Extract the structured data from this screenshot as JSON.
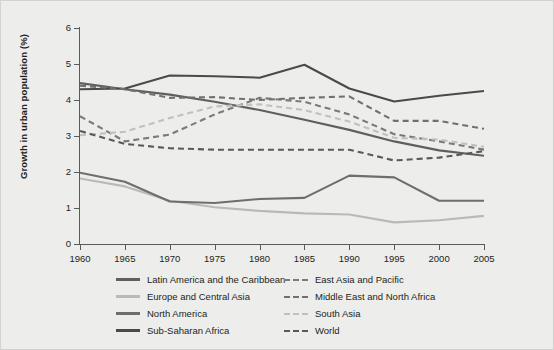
{
  "chart_data": {
    "type": "line",
    "title": "",
    "xlabel": "",
    "ylabel": "Growth in urban population (%)",
    "x": [
      1960,
      1965,
      1970,
      1975,
      1980,
      1985,
      1990,
      1995,
      2000,
      2005
    ],
    "xtick_labels": [
      "1960",
      "1965",
      "1970",
      "1975",
      "1980",
      "1985",
      "1990",
      "1995",
      "2000",
      "2005"
    ],
    "ytick_labels": [
      "0",
      "1",
      "2",
      "3",
      "4",
      "5",
      "6"
    ],
    "xlim": [
      1960,
      2005
    ],
    "ylim": [
      0,
      6
    ],
    "grid": false,
    "legend_position": "bottom",
    "series": [
      {
        "name": "Latin America and the Caribbean",
        "style": "solid",
        "color": "#5f5f5f",
        "values": [
          4.47,
          4.3,
          4.15,
          3.95,
          3.72,
          3.45,
          3.17,
          2.85,
          2.6,
          2.45
        ]
      },
      {
        "name": "Europe and Central Asia",
        "style": "solid",
        "color": "#b9b9b9",
        "values": [
          1.82,
          1.6,
          1.2,
          1.02,
          0.92,
          0.85,
          0.82,
          0.6,
          0.66,
          0.78
        ]
      },
      {
        "name": "North America",
        "style": "solid",
        "color": "#6e6e6e",
        "values": [
          1.98,
          1.73,
          1.18,
          1.14,
          1.25,
          1.28,
          1.9,
          1.85,
          1.2,
          1.2
        ]
      },
      {
        "name": "Sub-Saharan Africa",
        "style": "solid",
        "color": "#4a4a4a",
        "values": [
          4.3,
          4.32,
          4.68,
          4.66,
          4.62,
          4.98,
          4.32,
          3.96,
          4.12,
          4.25
        ]
      },
      {
        "name": "East Asia and Pacific",
        "style": "dashed",
        "color": "#7a7a7a",
        "values": [
          3.55,
          2.85,
          3.04,
          3.6,
          4.06,
          3.95,
          3.6,
          3.05,
          2.85,
          2.62
        ]
      },
      {
        "name": "Middle East and North Africa",
        "style": "dashed",
        "color": "#707070",
        "values": [
          4.4,
          4.3,
          4.06,
          4.08,
          4.0,
          4.06,
          4.1,
          3.42,
          3.42,
          3.2
        ]
      },
      {
        "name": "South Asia",
        "style": "dashed",
        "color": "#c0c0c0",
        "values": [
          3.02,
          3.12,
          3.5,
          3.82,
          3.88,
          3.72,
          3.4,
          2.95,
          2.9,
          2.7
        ]
      },
      {
        "name": "World",
        "style": "dashed",
        "color": "#595959",
        "values": [
          3.14,
          2.78,
          2.66,
          2.62,
          2.62,
          2.62,
          2.62,
          2.32,
          2.4,
          2.58
        ]
      }
    ]
  },
  "legend": {
    "items": [
      {
        "label": "Latin America and the Caribbean",
        "style": "solid",
        "color": "#5f5f5f"
      },
      {
        "label": "East Asia and Pacific",
        "style": "dashed",
        "color": "#7a7a7a"
      },
      {
        "label": "Europe and Central Asia",
        "style": "solid",
        "color": "#b9b9b9"
      },
      {
        "label": "Middle East and North Africa",
        "style": "dashed",
        "color": "#707070"
      },
      {
        "label": "North America",
        "style": "solid",
        "color": "#6e6e6e"
      },
      {
        "label": "South Asia",
        "style": "dashed",
        "color": "#c0c0c0"
      },
      {
        "label": "Sub-Saharan Africa",
        "style": "solid",
        "color": "#4a4a4a"
      },
      {
        "label": "World",
        "style": "dashed",
        "color": "#595959"
      }
    ]
  },
  "colors": {
    "background": "#ededeb",
    "axis": "#5a5a5a",
    "text": "#231f20"
  }
}
